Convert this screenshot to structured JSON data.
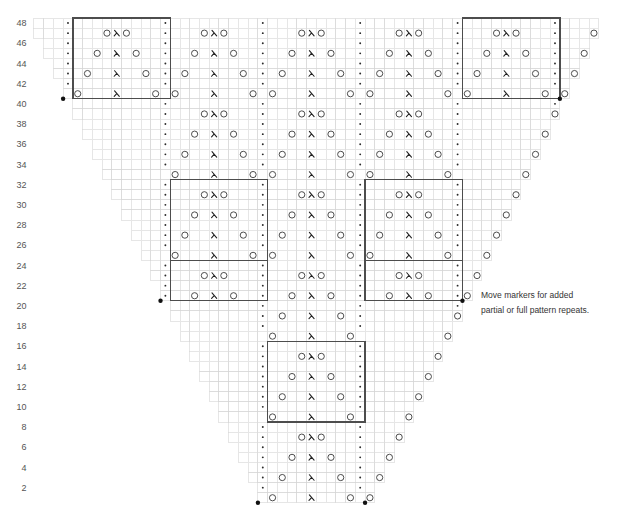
{
  "chart": {
    "type": "knitting-chart",
    "total_columns": 58,
    "total_rows": 48,
    "symbol_key": {
      "-": "empty-stitch",
      "o": "yarn-over-icon",
      "v": "double-decrease-icon",
      ".": "dot-stitch-icon"
    },
    "rows": [
      {
        "row": 48,
        "first_col": 0,
        "cells": "---.---------.---------.---------.---------.---------.----"
      },
      {
        "row": 47,
        "first_col": 0,
        "cells": "---.---ovo---.---ovo---.---ovo---.---ovo---.---ovo---.---o"
      },
      {
        "row": 46,
        "first_col": 1,
        "cells": "--.---------.---------.---------.---------.---------.---"
      },
      {
        "row": 45,
        "first_col": 1,
        "cells": "--.--o-v-o--.--o-v-o--.--o-v-o--.--o-v-o--.--o-v-o--.--o"
      },
      {
        "row": 44,
        "first_col": 2,
        "cells": "-.---------.---------.---------.---------.---------.--"
      },
      {
        "row": 43,
        "first_col": 2,
        "cells": "-.-o--v--o-.-o--v--o-.-o--v--o-.-o--v--o-.-o--v--o-.-o"
      },
      {
        "row": 42,
        "first_col": 3,
        "cells": ".---------.---------.---------.---------.---------.-"
      },
      {
        "row": 41,
        "first_col": 3,
        "cells": "-o---v---o-o---v---o-o---v---o-o---v---o-o---v---o-o"
      },
      {
        "row": 40,
        "first_col": 4,
        "cells": "---------.---------.---------.---------.---------."
      },
      {
        "row": 39,
        "first_col": 4,
        "cells": "---------.---ovo---.---ovo---.---ovo---.---------o"
      },
      {
        "row": 38,
        "first_col": 5,
        "cells": "--------.---------.---------.---------.---------"
      },
      {
        "row": 37,
        "first_col": 5,
        "cells": "--------.--o-v-o--.--o-v-o--.--o-v-o--.--------o"
      },
      {
        "row": 36,
        "first_col": 6,
        "cells": "-------.---------.---------.---------.--------"
      },
      {
        "row": 35,
        "first_col": 6,
        "cells": "-------.-o--v--o-.-o--v--o-.-o--v--o-.-------o"
      },
      {
        "row": 34,
        "first_col": 7,
        "cells": "------.---------.---------.---------.-------"
      },
      {
        "row": 33,
        "first_col": 7,
        "cells": "-------o---v---o-o---v---o-o---v---o-------o"
      },
      {
        "row": 32,
        "first_col": 8,
        "cells": "-----.---------.---------.---------.------"
      },
      {
        "row": 31,
        "first_col": 8,
        "cells": "-----.---ovo---.---ovo---.---ovo---.-----o"
      },
      {
        "row": 30,
        "first_col": 9,
        "cells": "----.---------.---------.---------.-----"
      },
      {
        "row": 29,
        "first_col": 9,
        "cells": "----.--o-v-o--.--o-v-o--.--o-v-o--.----o"
      },
      {
        "row": 28,
        "first_col": 10,
        "cells": "---.---------.---------.---------.----"
      },
      {
        "row": 27,
        "first_col": 10,
        "cells": "---.-o--v--o-.-o--v--o-.-o--v--o-.---o"
      },
      {
        "row": 26,
        "first_col": 11,
        "cells": "--.---------.---------.---------.---"
      },
      {
        "row": 25,
        "first_col": 11,
        "cells": "---o---v---o-o---v---o-o---v---o---o"
      },
      {
        "row": 24,
        "first_col": 12,
        "cells": "-.---------.---------.---------.--"
      },
      {
        "row": 23,
        "first_col": 12,
        "cells": "-.---ovo---.---ovo---.---ovo---.-o"
      },
      {
        "row": 22,
        "first_col": 13,
        "cells": ".---------.---------.---------.-"
      },
      {
        "row": 21,
        "first_col": 13,
        "cells": ".--o-v-o--.--o-v-o--.--o-v-o--.o"
      },
      {
        "row": 20,
        "first_col": 14,
        "cells": "---------.---------.---------."
      },
      {
        "row": 19,
        "first_col": 14,
        "cells": "---------.-o--v--o-.---------o"
      },
      {
        "row": 18,
        "first_col": 15,
        "cells": "--------.---------.---------"
      },
      {
        "row": 17,
        "first_col": 15,
        "cells": "---------o---v---o---------o"
      },
      {
        "row": 16,
        "first_col": 16,
        "cells": "-------.---------.--------"
      },
      {
        "row": 15,
        "first_col": 16,
        "cells": "-------.---ovo---.-------o"
      },
      {
        "row": 14,
        "first_col": 17,
        "cells": "------.---------.-------"
      },
      {
        "row": 13,
        "first_col": 17,
        "cells": "------.--o-v-o--.------o"
      },
      {
        "row": 12,
        "first_col": 18,
        "cells": "-----.---------.------"
      },
      {
        "row": 11,
        "first_col": 18,
        "cells": "-----.-o--v--o-.-----o"
      },
      {
        "row": 10,
        "first_col": 19,
        "cells": "----.---------.-----"
      },
      {
        "row": 9,
        "first_col": 19,
        "cells": "-----o---v---o-----o"
      },
      {
        "row": 8,
        "first_col": 20,
        "cells": "---.---------.----"
      },
      {
        "row": 7,
        "first_col": 20,
        "cells": "---.---ovo---.---o"
      },
      {
        "row": 6,
        "first_col": 21,
        "cells": "--.---------.---"
      },
      {
        "row": 5,
        "first_col": 21,
        "cells": "--.--o-v-o--.--o"
      },
      {
        "row": 4,
        "first_col": 22,
        "cells": "-.---------.--"
      },
      {
        "row": 3,
        "first_col": 22,
        "cells": "-.-o--v--o-.-o"
      },
      {
        "row": 2,
        "first_col": 23,
        "cells": ".---------.-"
      },
      {
        "row": 1,
        "first_col": 23,
        "cells": "-o---v---o-o"
      }
    ],
    "row_labels": [
      {
        "row": 48,
        "text": "48"
      },
      {
        "row": 46,
        "text": "46"
      },
      {
        "row": 44,
        "text": "44"
      },
      {
        "row": 42,
        "text": "42"
      },
      {
        "row": 40,
        "text": "40"
      },
      {
        "row": 38,
        "text": "38"
      },
      {
        "row": 36,
        "text": "36"
      },
      {
        "row": 34,
        "text": "34"
      },
      {
        "row": 32,
        "text": "32"
      },
      {
        "row": 30,
        "text": "30"
      },
      {
        "row": 28,
        "text": "28"
      },
      {
        "row": 26,
        "text": "26"
      },
      {
        "row": 24,
        "text": "24"
      },
      {
        "row": 22,
        "text": "22"
      },
      {
        "row": 20,
        "text": "20"
      },
      {
        "row": 18,
        "text": "18"
      },
      {
        "row": 16,
        "text": "16"
      },
      {
        "row": 14,
        "text": "14"
      },
      {
        "row": 12,
        "text": "12"
      },
      {
        "row": 10,
        "text": "10"
      },
      {
        "row": 8,
        "text": "8"
      },
      {
        "row": 6,
        "text": "6"
      },
      {
        "row": 4,
        "text": "4"
      },
      {
        "row": 2,
        "text": "2"
      }
    ],
    "repeat_boxes": [
      {
        "id": "top-left",
        "col_start": 4,
        "col_end": 13,
        "row_top": 48,
        "row_bottom": 41
      },
      {
        "id": "top-right",
        "col_start": 44,
        "col_end": 53,
        "row_top": 48,
        "row_bottom": 41
      },
      {
        "id": "mid-left-full",
        "col_start": 14,
        "col_end": 23,
        "row_top": 32,
        "row_bottom": 25
      },
      {
        "id": "mid-left-partial",
        "col_start": 14,
        "col_end": 23,
        "row_top": 24,
        "row_bottom": 21
      },
      {
        "id": "mid-right-full",
        "col_start": 34,
        "col_end": 43,
        "row_top": 32,
        "row_bottom": 25
      },
      {
        "id": "mid-right-partial",
        "col_start": 34,
        "col_end": 43,
        "row_top": 24,
        "row_bottom": 21
      },
      {
        "id": "center",
        "col_start": 24,
        "col_end": 33,
        "row_top": 16,
        "row_bottom": 9
      }
    ],
    "markers": [
      {
        "col_boundary": 3,
        "below_row": 41
      },
      {
        "col_boundary": 54,
        "below_row": 41
      },
      {
        "col_boundary": 13,
        "below_row": 21
      },
      {
        "col_boundary": 44,
        "below_row": 21
      },
      {
        "col_boundary": 23,
        "below_row": 1
      },
      {
        "col_boundary": 34,
        "below_row": 1
      }
    ]
  },
  "note": {
    "line1": "Move markers for added",
    "line2": "partial or full pattern repeats."
  }
}
